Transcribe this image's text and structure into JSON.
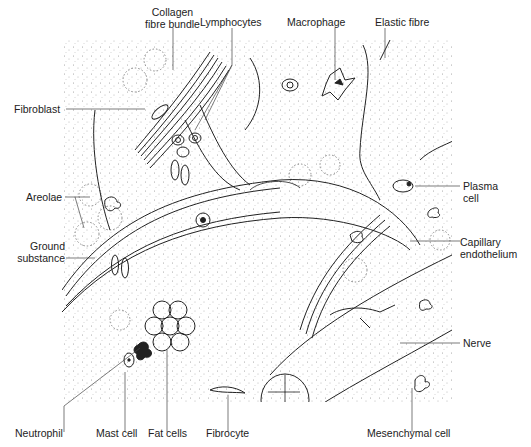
{
  "figure": {
    "labels": {
      "collagen": [
        "Collagen",
        "fibre bundle"
      ],
      "lymphocytes": "Lymphocytes",
      "macrophage": "Macrophage",
      "elastic": "Elastic fibre",
      "fibroblast": "Fibroblast",
      "areolae": "Areolae",
      "ground": [
        "Ground",
        "substance"
      ],
      "plasma": [
        "Plasma",
        "cell"
      ],
      "capillary": [
        "Capillary",
        "endothelium"
      ],
      "nerve": "Nerve",
      "neutrophil": "Neutrophil",
      "mast": "Mast cell",
      "fat": "Fat cells",
      "fibrocyte": "Fibrocyte",
      "mesenchymal": "Mesenchymal cell"
    },
    "colors": {
      "ink": "#222222",
      "stipple": "#9a9a9a",
      "background": "#ffffff"
    }
  }
}
